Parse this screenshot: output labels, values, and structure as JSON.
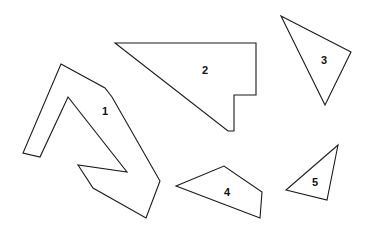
{
  "figure": {
    "width": 371,
    "height": 232,
    "background_color": "#ffffff",
    "stroke_color": "#1a1a1a",
    "label_color": "#111111",
    "stroke_width": 1.1
  },
  "shapes": [
    {
      "id": "shape-1",
      "label": "1",
      "kind": "concave-polygon",
      "vertex_count": 11,
      "label_x": 105,
      "label_y": 112,
      "points": "61,64 105,88 112,97 160,181 146,218 93,188 78,165 127,172 68,97 40,157 23,153"
    },
    {
      "id": "shape-2",
      "label": "2",
      "kind": "notched-triangle",
      "vertex_count": 6,
      "label_x": 205,
      "label_y": 71,
      "points": "115,43 256,43 256,95 234,95 234,131 228,131"
    },
    {
      "id": "shape-3",
      "label": "3",
      "kind": "triangle",
      "vertex_count": 3,
      "label_x": 324,
      "label_y": 61,
      "points": "281,16 351,52 325,105"
    },
    {
      "id": "shape-4",
      "label": "4",
      "kind": "quadrilateral",
      "vertex_count": 4,
      "label_x": 227,
      "label_y": 193,
      "points": "176,186 224,166 262,192 260,218"
    },
    {
      "id": "shape-5",
      "label": "5",
      "kind": "triangle",
      "vertex_count": 3,
      "label_x": 315,
      "label_y": 183,
      "points": "338,145 327,200 286,190"
    }
  ]
}
